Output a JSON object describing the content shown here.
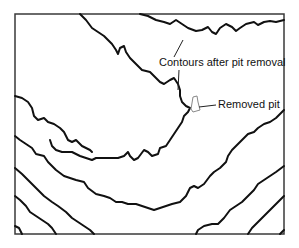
{
  "figure": {
    "type": "contour-map-diagram",
    "labels": {
      "contours": "Contours after pit removal",
      "pit": "Removed pit"
    },
    "colors": {
      "frame": "#3a3a3a",
      "contour": "#111111",
      "pit_outline": "#888888",
      "background": "#ffffff"
    },
    "frame": {
      "x": 15,
      "y": 14,
      "width": 269,
      "height": 220
    },
    "contour_count": 9
  }
}
